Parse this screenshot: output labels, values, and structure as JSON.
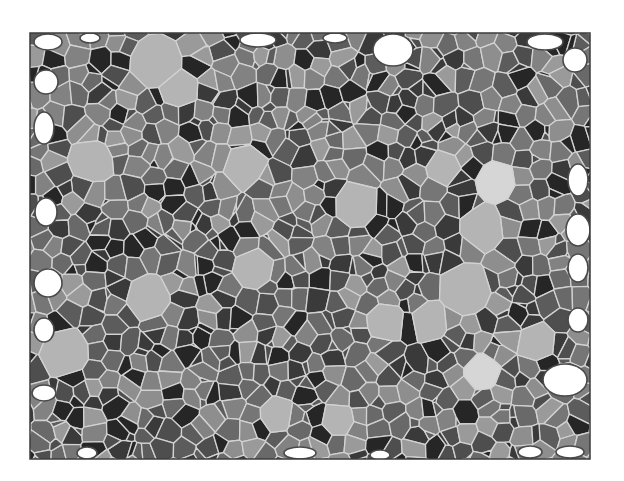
{
  "image": {
    "description": "Segmented grain microstructure map (grayscale polygonal grains with light boundaries, white voids along edges)",
    "width": 624,
    "height": 481,
    "background": "#ffffff"
  },
  "frame": {
    "x": 30,
    "y": 33,
    "width": 560,
    "height": 426,
    "stroke": "#3c3c3c",
    "stroke_width": 1.5
  },
  "palette": {
    "boundary": "#d2d2d2",
    "void_fill": "#ffffff",
    "void_outline": "#4a4a4a",
    "grain_levels": [
      "#262626",
      "#3a3a3a",
      "#4e4e4e",
      "#5c5c5c",
      "#696969",
      "#767676",
      "#828282",
      "#8e8e8e",
      "#9a9a9a"
    ],
    "light_grain": "#b4b4b4",
    "very_light_grain": "#d6d6d6"
  },
  "tessellation": {
    "random_seed": 7,
    "grid_cols": 30,
    "grid_rows": 23,
    "jitter": 0.85,
    "extra_small_grains": 260
  },
  "light_grains": [
    {
      "x": 155,
      "y": 62,
      "r": 30,
      "shade": "light_grain"
    },
    {
      "x": 178,
      "y": 90,
      "r": 20,
      "shade": "light_grain"
    },
    {
      "x": 245,
      "y": 165,
      "r": 22,
      "shade": "light_grain"
    },
    {
      "x": 92,
      "y": 160,
      "r": 24,
      "shade": "light_grain"
    },
    {
      "x": 356,
      "y": 205,
      "r": 26,
      "shade": "light_grain"
    },
    {
      "x": 444,
      "y": 168,
      "r": 18,
      "shade": "light_grain"
    },
    {
      "x": 497,
      "y": 180,
      "r": 20,
      "shade": "very_light_grain"
    },
    {
      "x": 482,
      "y": 228,
      "r": 24,
      "shade": "light_grain"
    },
    {
      "x": 255,
      "y": 268,
      "r": 22,
      "shade": "light_grain"
    },
    {
      "x": 148,
      "y": 298,
      "r": 24,
      "shade": "light_grain"
    },
    {
      "x": 465,
      "y": 290,
      "r": 30,
      "shade": "light_grain"
    },
    {
      "x": 430,
      "y": 320,
      "r": 20,
      "shade": "light_grain"
    },
    {
      "x": 538,
      "y": 343,
      "r": 20,
      "shade": "light_grain"
    },
    {
      "x": 482,
      "y": 372,
      "r": 20,
      "shade": "very_light_grain"
    },
    {
      "x": 65,
      "y": 352,
      "r": 28,
      "shade": "light_grain"
    },
    {
      "x": 385,
      "y": 322,
      "r": 22,
      "shade": "light_grain"
    },
    {
      "x": 276,
      "y": 415,
      "r": 18,
      "shade": "light_grain"
    },
    {
      "x": 338,
      "y": 420,
      "r": 18,
      "shade": "light_grain"
    }
  ],
  "voids": [
    {
      "x": 48,
      "y": 42,
      "rx": 14,
      "ry": 8
    },
    {
      "x": 90,
      "y": 38,
      "rx": 10,
      "ry": 5
    },
    {
      "x": 46,
      "y": 82,
      "rx": 12,
      "ry": 12
    },
    {
      "x": 44,
      "y": 128,
      "rx": 10,
      "ry": 16
    },
    {
      "x": 46,
      "y": 212,
      "rx": 11,
      "ry": 14
    },
    {
      "x": 48,
      "y": 283,
      "rx": 14,
      "ry": 14
    },
    {
      "x": 44,
      "y": 330,
      "rx": 10,
      "ry": 12
    },
    {
      "x": 44,
      "y": 393,
      "rx": 12,
      "ry": 8
    },
    {
      "x": 258,
      "y": 40,
      "rx": 18,
      "ry": 7
    },
    {
      "x": 335,
      "y": 38,
      "rx": 12,
      "ry": 5
    },
    {
      "x": 393,
      "y": 50,
      "rx": 20,
      "ry": 16
    },
    {
      "x": 545,
      "y": 42,
      "rx": 18,
      "ry": 8
    },
    {
      "x": 575,
      "y": 60,
      "rx": 12,
      "ry": 12
    },
    {
      "x": 578,
      "y": 180,
      "rx": 10,
      "ry": 16
    },
    {
      "x": 578,
      "y": 230,
      "rx": 12,
      "ry": 16
    },
    {
      "x": 578,
      "y": 268,
      "rx": 10,
      "ry": 14
    },
    {
      "x": 578,
      "y": 320,
      "rx": 10,
      "ry": 12
    },
    {
      "x": 565,
      "y": 380,
      "rx": 22,
      "ry": 16
    },
    {
      "x": 570,
      "y": 452,
      "rx": 14,
      "ry": 6
    },
    {
      "x": 87,
      "y": 453,
      "rx": 10,
      "ry": 6
    },
    {
      "x": 300,
      "y": 453,
      "rx": 16,
      "ry": 6
    },
    {
      "x": 380,
      "y": 455,
      "rx": 10,
      "ry": 5
    },
    {
      "x": 530,
      "y": 452,
      "rx": 12,
      "ry": 6
    }
  ]
}
